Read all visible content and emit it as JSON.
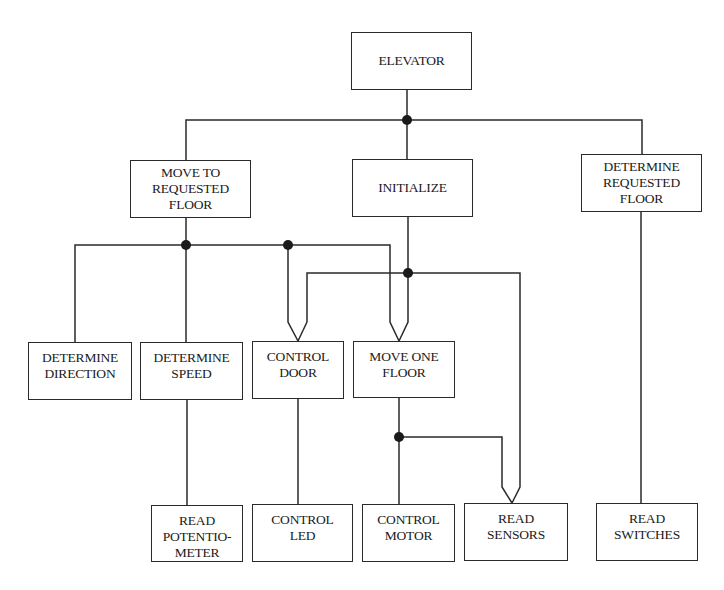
{
  "diagram": {
    "line_color": "#2a2a2a",
    "nodes": {
      "elevator": {
        "lines": [
          "ELEVATOR"
        ]
      },
      "move_to_requested_floor": {
        "lines": [
          "MOVE TO",
          "REQUESTED",
          "FLOOR"
        ]
      },
      "initialize": {
        "lines": [
          "INITIALIZE"
        ]
      },
      "determine_requested_floor": {
        "lines": [
          "DETERMINE",
          "REQUESTED",
          "FLOOR"
        ]
      },
      "determine_direction": {
        "lines": [
          "DETERMINE",
          "DIRECTION"
        ]
      },
      "determine_speed": {
        "lines": [
          "DETERMINE",
          "SPEED"
        ]
      },
      "control_door": {
        "lines": [
          "CONTROL",
          "DOOR"
        ]
      },
      "move_one_floor": {
        "lines": [
          "MOVE ONE",
          "FLOOR"
        ]
      },
      "read_potentiometer": {
        "lines": [
          "READ",
          "POTENTIO-",
          "METER"
        ]
      },
      "control_led": {
        "lines": [
          "CONTROL",
          "LED"
        ]
      },
      "control_motor": {
        "lines": [
          "CONTROL",
          "MOTOR"
        ]
      },
      "read_sensors": {
        "lines": [
          "READ",
          "SENSORS"
        ]
      },
      "read_switches": {
        "lines": [
          "READ",
          "SWITCHES"
        ]
      }
    },
    "edges": [
      {
        "from": "elevator",
        "to": "move_to_requested_floor"
      },
      {
        "from": "elevator",
        "to": "initialize"
      },
      {
        "from": "elevator",
        "to": "determine_requested_floor"
      },
      {
        "from": "move_to_requested_floor",
        "to": "determine_direction"
      },
      {
        "from": "move_to_requested_floor",
        "to": "determine_speed"
      },
      {
        "from": "move_to_requested_floor",
        "to": "control_door"
      },
      {
        "from": "move_to_requested_floor",
        "to": "move_one_floor"
      },
      {
        "from": "initialize",
        "to": "control_door"
      },
      {
        "from": "initialize",
        "to": "move_one_floor"
      },
      {
        "from": "initialize",
        "to": "read_sensors"
      },
      {
        "from": "determine_speed",
        "to": "read_potentiometer"
      },
      {
        "from": "control_door",
        "to": "control_led"
      },
      {
        "from": "move_one_floor",
        "to": "control_motor"
      },
      {
        "from": "move_one_floor",
        "to": "read_sensors"
      },
      {
        "from": "determine_requested_floor",
        "to": "read_switches"
      }
    ]
  },
  "caption": {
    "text": ""
  }
}
